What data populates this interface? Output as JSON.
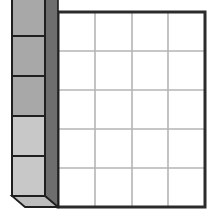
{
  "figure": {
    "title": "",
    "background_color": "#ffffff",
    "width": 214,
    "height": 219
  },
  "colors": {
    "grid_border": "#2b2b2b",
    "grid_inner_line": "#b5b5b5",
    "cell_fill": "#ffffff",
    "block_face_dark": "#a8a8a8",
    "block_face_light": "#c8c8c8",
    "block_side_dark": "#6e6e6e",
    "block_side_mid": "#8a8a8a",
    "block_bottom": "#bdbdbd",
    "block_outline": "#1f1f1f",
    "connector_line": "#3a3a3a"
  },
  "grid": {
    "name": "table-grid",
    "columns": 4,
    "rows": 5,
    "x": 58,
    "y": 12,
    "width": 147,
    "height": 195,
    "border_width": 3,
    "inner_line_width": 1.6,
    "column_edges": [
      58,
      95,
      132,
      168,
      205
    ],
    "row_edges": [
      12,
      51,
      90,
      129,
      168,
      207
    ],
    "cells": [
      [
        "",
        "",
        "",
        ""
      ],
      [
        "",
        "",
        "",
        ""
      ],
      [
        "",
        "",
        "",
        ""
      ],
      [
        "",
        "",
        "",
        ""
      ],
      [
        "",
        "",
        "",
        ""
      ]
    ]
  },
  "block": {
    "name": "stacked-3d-block",
    "front_x": 12,
    "front_right_x": 45,
    "side_right_x": 58,
    "top_y": -4,
    "bottom_y": 196,
    "depth_rise": 10,
    "bottom_skew": 12,
    "segments": [
      {
        "label": "",
        "index": 1,
        "top": -4,
        "bottom": 36,
        "shade": "dark"
      },
      {
        "label": "",
        "index": 2,
        "top": 36,
        "bottom": 76,
        "shade": "dark"
      },
      {
        "label": "",
        "index": 3,
        "top": 76,
        "bottom": 116,
        "shade": "dark"
      },
      {
        "label": "",
        "index": 4,
        "top": 116,
        "bottom": 156,
        "shade": "light"
      },
      {
        "label": "",
        "index": 5,
        "top": 156,
        "bottom": 196,
        "shade": "light"
      }
    ],
    "connectors": [
      {
        "from_x": 45,
        "from_y": 36,
        "to_x": 58,
        "to_y": 51
      },
      {
        "from_x": 45,
        "from_y": 76,
        "to_x": 58,
        "to_y": 90
      },
      {
        "from_x": 45,
        "from_y": 116,
        "to_x": 58,
        "to_y": 129
      },
      {
        "from_x": 45,
        "from_y": 156,
        "to_x": 58,
        "to_y": 168
      },
      {
        "from_x": 45,
        "from_y": 196,
        "to_x": 58,
        "to_y": 207
      }
    ]
  },
  "annotations": {
    "caption": "",
    "legend": []
  }
}
